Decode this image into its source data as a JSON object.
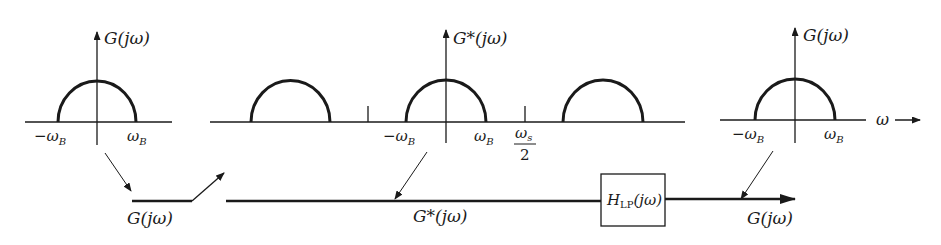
{
  "diagram": {
    "type": "sampling-reconstruction-block-diagram",
    "colors": {
      "stroke": "#1a1a1a",
      "background": "#ffffff"
    },
    "plots": [
      {
        "id": "input-spectrum",
        "y_label": "G(jω)",
        "tick_labels": {
          "left": "−ω",
          "left_sub": "B",
          "right": "ω",
          "right_sub": "B"
        }
      },
      {
        "id": "sampled-spectrum",
        "y_label": "G*(jω)",
        "tick_labels": {
          "left": "−ω",
          "left_sub": "B",
          "right": "ω",
          "right_sub": "B",
          "half_fs_num": "ω",
          "half_fs_num_sub": "s",
          "half_fs_den": "2"
        },
        "replica_count": 3
      },
      {
        "id": "output-spectrum",
        "y_label": "G(jω)",
        "tick_labels": {
          "left": "−ω",
          "left_sub": "B",
          "right": "ω",
          "right_sub": "B"
        },
        "x_label": "ω"
      }
    ],
    "signal_path": {
      "input_label": "G(jω)",
      "sampled_label": "G*(jω)",
      "filter_label": "H",
      "filter_label_sub": "LP",
      "filter_label_arg": "(jω)",
      "output_label": "G(jω)"
    }
  }
}
